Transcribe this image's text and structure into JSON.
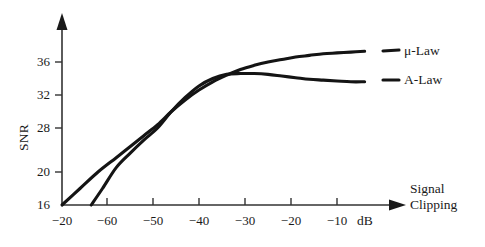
{
  "chart_data": {
    "type": "line",
    "title": "",
    "xlabel": "Signal Clipping dB",
    "ylabel": "SNR",
    "xlabel_line1": "Signal",
    "xlabel_line2": "Clipping",
    "xlabel_unit": "dB",
    "x_tick_labels": [
      "−20",
      "−60",
      "−50",
      "−40",
      "−30",
      "−20",
      "−10"
    ],
    "y_tick_labels": [
      "36",
      "32",
      "28",
      "20",
      "16"
    ],
    "xlim": [
      -70,
      -3
    ],
    "ylim": [
      16,
      38
    ],
    "grid": false,
    "legend_position": "right-inline",
    "axis_arrows": true,
    "series": [
      {
        "name": "μ-Law",
        "label": "μ-Law",
        "color": "#141414",
        "x": [
          -70,
          -66,
          -62,
          -58,
          -55,
          -52,
          -49,
          -46,
          -43,
          -40,
          -37,
          -34,
          -31,
          -28,
          -25,
          -22,
          -19,
          -16,
          -13,
          -10,
          -7,
          -4
        ],
        "y": [
          16.0,
          18.0,
          20.0,
          22.6,
          24.6,
          26.6,
          28.4,
          30.0,
          31.4,
          32.6,
          33.6,
          34.4,
          35.1,
          35.6,
          36.0,
          36.3,
          36.6,
          36.8,
          37.0,
          37.1,
          37.2,
          37.3
        ]
      },
      {
        "name": "A-Law",
        "label": "A-Law",
        "color": "#141414",
        "x": [
          -63.5,
          -61,
          -58,
          -55,
          -52,
          -49,
          -46,
          -43,
          -40,
          -37,
          -34,
          -31,
          -28,
          -25,
          -22,
          -19,
          -16,
          -13,
          -10,
          -7,
          -4
        ],
        "y": [
          16.0,
          18.0,
          20.8,
          23.4,
          25.8,
          28.0,
          30.0,
          31.7,
          33.1,
          34.0,
          34.5,
          34.6,
          34.6,
          34.5,
          34.3,
          34.1,
          33.9,
          33.8,
          33.7,
          33.6,
          33.6
        ]
      }
    ]
  },
  "axis": {
    "y_title": "SNR"
  }
}
